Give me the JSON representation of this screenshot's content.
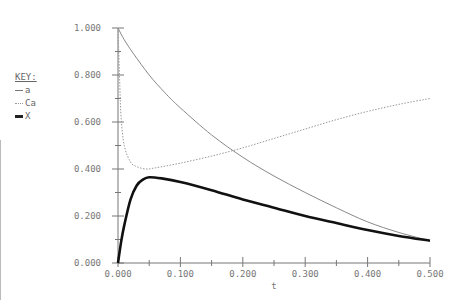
{
  "legend": {
    "title": "KEY:",
    "items": [
      {
        "label": "a",
        "style": "solid-thin"
      },
      {
        "label": "Ca",
        "style": "dotted"
      },
      {
        "label": "X",
        "style": "solid-bold"
      }
    ]
  },
  "axes": {
    "xlabel": "t",
    "xticks": [
      "0.000",
      "0.100",
      "0.200",
      "0.300",
      "0.400",
      "0.500"
    ],
    "yticks": [
      "0.000",
      "0.200",
      "0.400",
      "0.600",
      "0.800",
      "1.000"
    ]
  },
  "colors": {
    "a": "#888888",
    "Ca": "#999999",
    "X": "#111111",
    "axis": "#777777"
  },
  "chart_data": {
    "type": "line",
    "title": "",
    "xlabel": "t",
    "ylabel": "",
    "xlim": [
      0,
      0.5
    ],
    "ylim": [
      0,
      1.0
    ],
    "grid": false,
    "legend_position": "left",
    "series": [
      {
        "name": "a",
        "style": "solid-thin",
        "x": [
          0,
          0.01,
          0.025,
          0.05,
          0.075,
          0.1,
          0.15,
          0.2,
          0.25,
          0.3,
          0.35,
          0.4,
          0.45,
          0.5
        ],
        "y": [
          1.0,
          0.95,
          0.89,
          0.8,
          0.725,
          0.66,
          0.545,
          0.45,
          0.37,
          0.3,
          0.235,
          0.175,
          0.13,
          0.095
        ]
      },
      {
        "name": "Ca",
        "style": "dotted",
        "x": [
          0,
          0.003,
          0.005,
          0.01,
          0.02,
          0.03,
          0.045,
          0.06,
          0.1,
          0.15,
          0.2,
          0.25,
          0.3,
          0.35,
          0.4,
          0.45,
          0.5
        ],
        "y": [
          1.0,
          0.75,
          0.62,
          0.5,
          0.43,
          0.41,
          0.4,
          0.405,
          0.425,
          0.455,
          0.49,
          0.53,
          0.57,
          0.61,
          0.645,
          0.675,
          0.7
        ]
      },
      {
        "name": "X",
        "style": "solid-bold",
        "x": [
          0,
          0.005,
          0.01,
          0.02,
          0.03,
          0.04,
          0.05,
          0.07,
          0.1,
          0.15,
          0.2,
          0.25,
          0.3,
          0.35,
          0.4,
          0.45,
          0.5
        ],
        "y": [
          0,
          0.09,
          0.16,
          0.27,
          0.33,
          0.355,
          0.365,
          0.36,
          0.345,
          0.31,
          0.27,
          0.235,
          0.2,
          0.17,
          0.14,
          0.115,
          0.095
        ]
      }
    ]
  }
}
